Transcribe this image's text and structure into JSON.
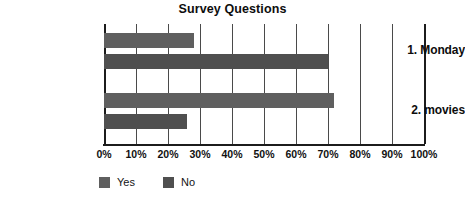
{
  "chart_data": {
    "type": "bar",
    "orientation": "horizontal",
    "title": "Survey Questions",
    "xlabel": "",
    "ylabel": "",
    "categories": [
      "1. Monday",
      "2. movies"
    ],
    "series": [
      {
        "name": "Yes",
        "values": [
          28,
          72
        ],
        "color": "#5f5f5f"
      },
      {
        "name": "No",
        "values": [
          70,
          26
        ],
        "color": "#4f4f4f"
      }
    ],
    "xlim": [
      0,
      100
    ],
    "xtick_labels": [
      "0%",
      "10%",
      "20%",
      "30%",
      "40%",
      "50%",
      "60%",
      "70%",
      "80%",
      "90%",
      "100%"
    ],
    "xtick_values": [
      0,
      10,
      20,
      30,
      40,
      50,
      60,
      70,
      80,
      90,
      100
    ],
    "grid": true,
    "grid_axis": "x",
    "legend_position": "bottom-left",
    "legend_entries": [
      "Yes",
      "No"
    ],
    "value_labels_shown": false
  },
  "colors": {
    "background": "#ffffff",
    "grid": "#4a4a4a",
    "axis": "#1c1c1c",
    "text": "#111111",
    "series_yes": "#5f5f5f",
    "series_no": "#4f4f4f"
  }
}
